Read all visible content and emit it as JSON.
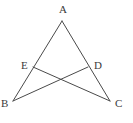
{
  "figure": {
    "background_color": "#ffffff",
    "line_color": "#4a4a4a",
    "label_color": "#3b3b3b",
    "width": 133,
    "height": 123,
    "points": {
      "A": {
        "label": "A",
        "x": 62,
        "y": 21,
        "label_x": 59,
        "label_y": 4
      },
      "B": {
        "label": "B",
        "x": 13,
        "y": 101,
        "label_x": 1,
        "label_y": 98
      },
      "C": {
        "label": "C",
        "x": 110,
        "y": 101,
        "label_x": 115,
        "label_y": 98
      },
      "D": {
        "label": "D",
        "x": 88,
        "y": 67,
        "label_x": 94,
        "label_y": 60
      },
      "E": {
        "label": "E",
        "x": 33,
        "y": 67,
        "label_x": 21,
        "label_y": 60
      }
    },
    "segments": [
      {
        "name": "side-AB",
        "from": "A",
        "to": "B",
        "x1": 62,
        "y1": 21,
        "x2": 13,
        "y2": 101
      },
      {
        "name": "side-AC",
        "from": "A",
        "to": "C",
        "x1": 62,
        "y1": 21,
        "x2": 110,
        "y2": 101
      },
      {
        "name": "cevian-EC",
        "from": "E",
        "to": "C",
        "x1": 33,
        "y1": 67,
        "x2": 110,
        "y2": 101
      },
      {
        "name": "cevian-DB",
        "from": "D",
        "to": "B",
        "x1": 88,
        "y1": 67,
        "x2": 13,
        "y2": 101
      }
    ]
  }
}
